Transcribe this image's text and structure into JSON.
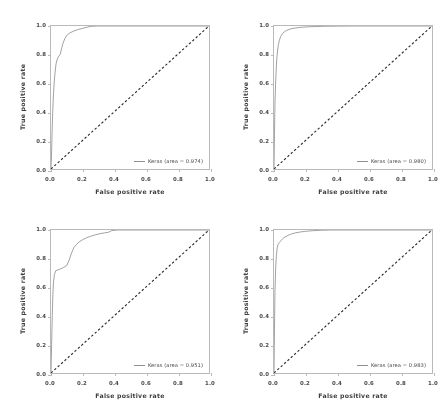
{
  "figure": {
    "layout": "2x2 grid of ROC curve subplots",
    "background": "#ffffff",
    "curve_color": "#8f8f8f",
    "chance_line_color": "#2b2b2b",
    "frame_color": "#b9b9b9"
  },
  "axis": {
    "xlabel": "False positive rate",
    "ylabel": "True positive rate",
    "xticks": [
      "0.0",
      "0.2",
      "0.4",
      "0.6",
      "0.8",
      "1.0"
    ],
    "yticks": [
      "0.0",
      "0.2",
      "0.4",
      "0.6",
      "0.8",
      "1.0"
    ],
    "xlim": [
      0,
      1
    ],
    "ylim": [
      0,
      1
    ]
  },
  "chart_data": [
    {
      "type": "line",
      "panel": "top-left",
      "title": "",
      "xlabel": "False positive rate",
      "ylabel": "True positive rate",
      "xlim": [
        0,
        1
      ],
      "ylim": [
        0,
        1
      ],
      "grid": false,
      "legend_position": "lower right",
      "legend": [
        "Keras (area = 0.974)"
      ],
      "auc": 0.974,
      "series": [
        {
          "name": "Keras (area = 0.974)",
          "style": "solid",
          "color": "#8f8f8f",
          "x": [
            0.0,
            0.004,
            0.008,
            0.012,
            0.016,
            0.02,
            0.024,
            0.028,
            0.032,
            0.038,
            0.044,
            0.05,
            0.058,
            0.066,
            0.076,
            0.088,
            0.1,
            0.12,
            0.145,
            0.17,
            0.2,
            0.23,
            0.255,
            0.3,
            0.4,
            0.5,
            0.6,
            0.7,
            0.8,
            0.9,
            1.0
          ],
          "y": [
            0.0,
            0.13,
            0.3,
            0.43,
            0.53,
            0.6,
            0.655,
            0.7,
            0.735,
            0.762,
            0.778,
            0.79,
            0.8,
            0.838,
            0.88,
            0.912,
            0.935,
            0.952,
            0.965,
            0.975,
            0.984,
            0.992,
            0.998,
            1.0,
            1.0,
            1.0,
            1.0,
            1.0,
            1.0,
            1.0,
            1.0
          ]
        },
        {
          "name": "chance",
          "style": "dashed",
          "color": "#2b2b2b",
          "x": [
            0,
            1
          ],
          "y": [
            0,
            1
          ]
        }
      ]
    },
    {
      "type": "line",
      "panel": "top-right",
      "title": "",
      "xlabel": "False positive rate",
      "ylabel": "True positive rate",
      "xlim": [
        0,
        1
      ],
      "ylim": [
        0,
        1
      ],
      "grid": false,
      "legend_position": "lower right",
      "legend": [
        "Keras (area = 0.980)"
      ],
      "auc": 0.98,
      "series": [
        {
          "name": "Keras (area = 0.980)",
          "style": "solid",
          "color": "#8f8f8f",
          "x": [
            0.0,
            0.003,
            0.006,
            0.01,
            0.014,
            0.018,
            0.022,
            0.028,
            0.034,
            0.042,
            0.052,
            0.064,
            0.078,
            0.095,
            0.115,
            0.14,
            0.17,
            0.21,
            0.26,
            0.32,
            0.4,
            0.5,
            0.6,
            0.7,
            0.8,
            0.9,
            1.0
          ],
          "y": [
            0.0,
            0.24,
            0.45,
            0.6,
            0.7,
            0.775,
            0.825,
            0.87,
            0.9,
            0.925,
            0.945,
            0.958,
            0.968,
            0.976,
            0.982,
            0.987,
            0.991,
            0.994,
            0.996,
            0.998,
            0.999,
            1.0,
            1.0,
            1.0,
            1.0,
            1.0,
            1.0
          ]
        },
        {
          "name": "chance",
          "style": "dashed",
          "color": "#2b2b2b",
          "x": [
            0,
            1
          ],
          "y": [
            0,
            1
          ]
        }
      ]
    },
    {
      "type": "line",
      "panel": "bottom-left",
      "title": "",
      "xlabel": "False positive rate",
      "ylabel": "True positive rate",
      "xlim": [
        0,
        1
      ],
      "ylim": [
        0,
        1
      ],
      "grid": false,
      "legend_position": "lower right",
      "legend": [
        "Keras (area = 0.951)"
      ],
      "auc": 0.951,
      "series": [
        {
          "name": "Keras (area = 0.951)",
          "style": "solid",
          "color": "#8f8f8f",
          "x": [
            0.0,
            0.004,
            0.008,
            0.012,
            0.016,
            0.022,
            0.03,
            0.045,
            0.06,
            0.08,
            0.1,
            0.115,
            0.13,
            0.145,
            0.16,
            0.18,
            0.2,
            0.225,
            0.25,
            0.28,
            0.31,
            0.34,
            0.365,
            0.385,
            0.42,
            0.5,
            0.6,
            0.7,
            0.8,
            0.9,
            1.0
          ],
          "y": [
            0.0,
            0.2,
            0.4,
            0.55,
            0.64,
            0.69,
            0.715,
            0.722,
            0.728,
            0.738,
            0.752,
            0.79,
            0.84,
            0.878,
            0.898,
            0.918,
            0.932,
            0.946,
            0.956,
            0.966,
            0.974,
            0.98,
            0.985,
            0.996,
            1.0,
            1.0,
            1.0,
            1.0,
            1.0,
            1.0,
            1.0
          ]
        },
        {
          "name": "chance",
          "style": "dashed",
          "color": "#2b2b2b",
          "x": [
            0,
            1
          ],
          "y": [
            0,
            1
          ]
        }
      ]
    },
    {
      "type": "line",
      "panel": "bottom-right",
      "title": "",
      "xlabel": "False positive rate",
      "ylabel": "True positive rate",
      "xlim": [
        0,
        1
      ],
      "ylim": [
        0,
        1
      ],
      "grid": false,
      "legend_position": "lower right",
      "legend": [
        "Keras (area = 0.983)"
      ],
      "auc": 0.983,
      "series": [
        {
          "name": "Keras (area = 0.983)",
          "style": "solid",
          "color": "#8f8f8f",
          "x": [
            0.0,
            0.003,
            0.006,
            0.01,
            0.015,
            0.02,
            0.026,
            0.034,
            0.044,
            0.056,
            0.07,
            0.088,
            0.11,
            0.135,
            0.165,
            0.2,
            0.245,
            0.3,
            0.36,
            0.43,
            0.5,
            0.6,
            0.7,
            0.8,
            0.9,
            1.0
          ],
          "y": [
            0.0,
            0.3,
            0.56,
            0.72,
            0.82,
            0.875,
            0.9,
            0.912,
            0.925,
            0.94,
            0.952,
            0.962,
            0.972,
            0.98,
            0.986,
            0.991,
            0.995,
            0.998,
            1.0,
            1.0,
            1.0,
            1.0,
            1.0,
            1.0,
            1.0,
            1.0
          ]
        },
        {
          "name": "chance",
          "style": "dashed",
          "color": "#2b2b2b",
          "x": [
            0,
            1
          ],
          "y": [
            0,
            1
          ]
        }
      ]
    }
  ]
}
